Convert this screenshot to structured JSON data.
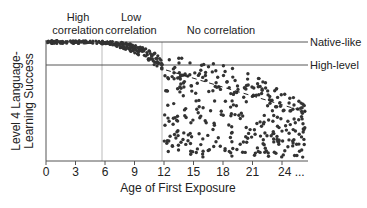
{
  "chart_data": {
    "type": "scatter",
    "title": "",
    "xlabel": "Age of First Exposure",
    "ylabel": "Level 4 Language-Learning Success",
    "ylabel_lines": [
      "Level 4 Language-",
      "Learning Success"
    ],
    "x_ticks": [
      "0",
      "3",
      "6",
      "9",
      "12",
      "15",
      "18",
      "21",
      "24 ..."
    ],
    "xlim": [
      0,
      26
    ],
    "grid": false,
    "region_labels": [
      {
        "lines": [
          "High",
          "correlation"
        ],
        "x_range": [
          0,
          6
        ]
      },
      {
        "lines": [
          "Low",
          "correlation"
        ],
        "x_range": [
          6,
          12
        ]
      },
      {
        "lines": [
          "No correlation"
        ],
        "x_range": [
          12,
          26
        ]
      }
    ],
    "reference_lines": [
      {
        "label": "Native-like",
        "type": "horizontal"
      },
      {
        "label": "High-level",
        "type": "horizontal"
      }
    ],
    "vertical_dividers": [
      6,
      12
    ],
    "trend": {
      "style": "dashed",
      "from_x": 12,
      "to_x": 26,
      "description": "declining average beyond age 12"
    }
  },
  "colors": {
    "dot": "#333333",
    "axis": "#555555",
    "reference_line": "#444444",
    "divider": "#aaaaaa"
  }
}
